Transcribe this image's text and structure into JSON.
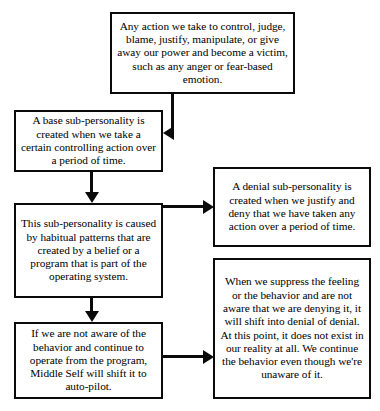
{
  "diagram": {
    "ink_color": "#0a0a0a",
    "background_color": "#ffffff",
    "nodes": [
      {
        "id": "action",
        "name": "any-action-box",
        "text": "Any action we take to control, judge, blame, justify, manipulate, or give away our power and become a victim, such as any anger or fear-based emotion."
      },
      {
        "id": "base",
        "name": "base-sub-personality-box",
        "text": "A base sub-personality is created when we take a certain controlling action over a period of time."
      },
      {
        "id": "subpers",
        "name": "this-sub-personality-box",
        "text": "This sub-personality is caused by habitual patterns that are created by a belief or a program that is part of the operating system."
      },
      {
        "id": "notaware",
        "name": "not-aware-auto-pilot-box",
        "text": "If we are not aware of the behavior and continue to operate from the program, Middle Self will shift it to auto-pilot."
      },
      {
        "id": "denial",
        "name": "denial-sub-personality-box",
        "text": "A denial sub-personality is created when we justify and deny that we have taken any action over a period of time."
      },
      {
        "id": "suppress",
        "name": "suppress-denial-of-denial-box",
        "text": "When we suppress the feeling or the behavior and are not aware that we are denying it, it will shift into denial of denial. At this point, it does not exist in our reality at all. We continue the behavior even though we're unaware of it."
      }
    ],
    "connectors": [
      {
        "id": "action-to-base",
        "from": "action",
        "to": "base",
        "shape": "down-then-left",
        "arrow": "left"
      },
      {
        "id": "base-to-subpers",
        "from": "base",
        "to": "subpers",
        "shape": "down",
        "arrow": "down"
      },
      {
        "id": "subpers-to-denial",
        "from": "subpers",
        "to": "denial",
        "shape": "right",
        "arrow": "right"
      },
      {
        "id": "subpers-to-notaware",
        "from": "subpers",
        "to": "notaware",
        "shape": "down",
        "arrow": "down"
      },
      {
        "id": "notaware-to-suppress",
        "from": "notaware",
        "to": "suppress",
        "shape": "right",
        "arrow": "right"
      }
    ]
  }
}
